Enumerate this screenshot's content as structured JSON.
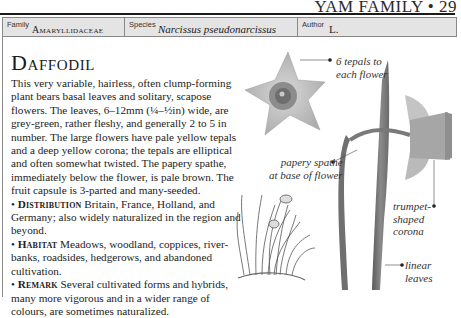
{
  "running_head": "YAM FAMILY • 29",
  "header": {
    "family_label": "Family",
    "family_value": "Amaryllidaceae",
    "species_label": "Species",
    "species_value": "Narcissus pseudonarcissus",
    "author_label": "Author",
    "author_value": "L."
  },
  "entry": {
    "title": "Daffodil",
    "description": "This very variable, hairless, often clump-forming plant bears basal leaves and solitary, scapose flowers. The leaves, 6–12mm (¼–½in) wide, are grey-green, rather fleshy, and generally 2 to 5 in number. The large flowers have pale yellow tepals and a deep yellow corona; the tepals are elliptical and often somewhat twisted. The papery spathe, immediately below the flower, is pale brown. The fruit capsule is 3-parted and many-seeded.",
    "sections": [
      {
        "heading": "Distribution",
        "text": "Britain, France, Holland, and Germany; also widely naturalized in the region and beyond."
      },
      {
        "heading": "Habitat",
        "text": "Meadows, woodland, coppices, river-banks, roadsides, hedgerows, and abandoned cultivation."
      },
      {
        "heading": "Remark",
        "text": "Several cultivated forms and hybrids, many more vigorous and in a wider range of colours, are sometimes naturalized."
      }
    ]
  },
  "callouts": {
    "tepals": [
      "6 tepals to",
      "each flower"
    ],
    "spathe": [
      "papery spathe",
      "at base of flower"
    ],
    "corona": [
      "trumpet-",
      "shaped corona"
    ],
    "leaves": [
      "linear",
      "leaves"
    ]
  }
}
